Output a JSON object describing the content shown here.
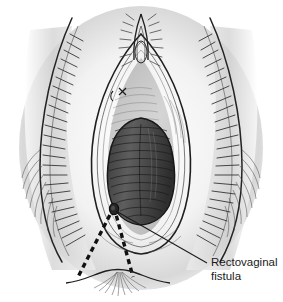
{
  "figure": {
    "type": "medical-line-drawing",
    "background_color": "#ffffff",
    "ink_color": "#1a1a1a",
    "shading_color": "#c8c8c8",
    "canvas": {
      "width": 283,
      "height": 302
    }
  },
  "annotation": {
    "label_line_1": "Rectovaginal",
    "label_line_2": "fistula",
    "label_color": "#1a1a1a",
    "leader_line": {
      "from_x": 116,
      "from_y": 211,
      "to_x": 207,
      "to_y": 263,
      "color": "#1a1a1a"
    }
  },
  "fistula_marker": {
    "name": "fistula-opening",
    "cx": 114,
    "cy": 209,
    "rx": 4.2,
    "ry": 5.4,
    "color": "#262626"
  },
  "fistula_tract": {
    "name": "dashed-fistula-tract",
    "color": "#111111",
    "dash": "5,4",
    "width": 3.4,
    "apex_x": 114,
    "apex_y": 207,
    "left_base_x": 78,
    "left_base_y": 277,
    "right_base_x": 133,
    "right_base_y": 277
  },
  "structures": {
    "vaginal_introitus": "dark-oval-canal",
    "vestibule": "inner-vestibule",
    "urethral_meatus": "urethra-mark",
    "clitoral_hood": "apex-hood",
    "labia_majora_left": "left-outer-fold",
    "labia_majora_right": "right-outer-fold",
    "anus": "anal-verge-arc"
  }
}
